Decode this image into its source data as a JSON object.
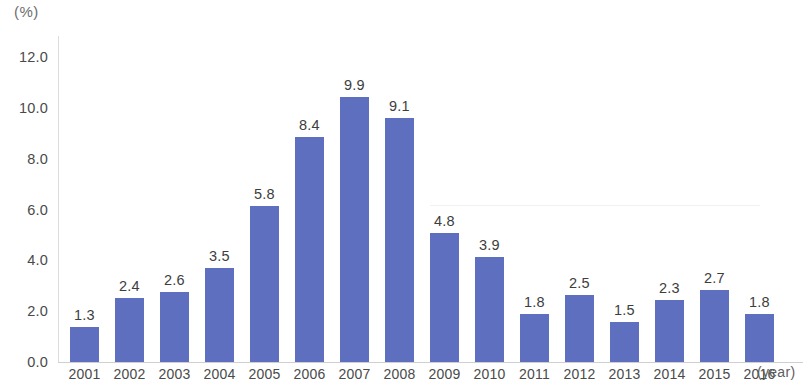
{
  "chart_data": {
    "type": "bar",
    "title": "",
    "subtitle": "",
    "xlabel": "(year)",
    "ylabel": "(%)",
    "categories": [
      "2001",
      "2002",
      "2003",
      "2004",
      "2005",
      "2006",
      "2007",
      "2008",
      "2009",
      "2010",
      "2011",
      "2012",
      "2013",
      "2014",
      "2015",
      "2016"
    ],
    "values": [
      1.3,
      2.4,
      2.6,
      3.5,
      5.8,
      8.4,
      9.9,
      9.1,
      4.8,
      3.9,
      1.8,
      2.5,
      1.5,
      2.3,
      2.7,
      1.8
    ],
    "data_labels": [
      "1.3",
      "2.4",
      "2.6",
      "3.5",
      "5.8",
      "8.4",
      "9.9",
      "9.1",
      "4.8",
      "3.9",
      "1.8",
      "2.5",
      "1.5",
      "2.3",
      "2.7",
      "1.8"
    ],
    "ylim": [
      0.0,
      12.0
    ],
    "ytick_labels": [
      "0.0",
      "2.0",
      "4.0",
      "6.0",
      "8.0",
      "10.0",
      "12.0"
    ],
    "ytick_values": [
      0.0,
      2.0,
      4.0,
      6.0,
      8.0,
      10.0,
      12.0
    ],
    "grid": false,
    "legend": null,
    "legend_position": "none",
    "series_color": "#5f6fbf",
    "axis_color": "#d5d5d5",
    "label_color": "#3d3d3d",
    "background": "#ffffff"
  }
}
